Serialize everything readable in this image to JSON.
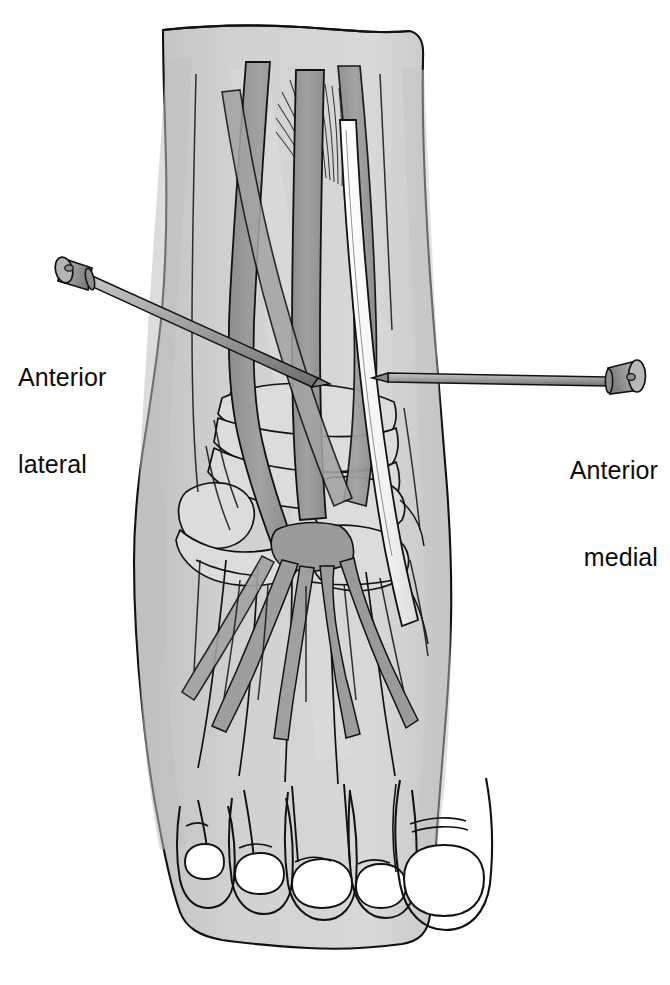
{
  "figure": {
    "background_color": "#ffffff"
  },
  "labels": {
    "anterior_lateral": {
      "line1": "Anterior",
      "line2": "lateral",
      "align": "left"
    },
    "anterior_medial": {
      "line1": "Anterior",
      "line2": "medial",
      "align": "right"
    }
  },
  "colors": {
    "skin_fill": "#d2d2d2",
    "skin_shadow": "#b9b9b9",
    "skin_highlight": "#dedede",
    "bone_fill": "#dcdcdc",
    "bone_light": "#e4e4e4",
    "tendon_dark": "#969696",
    "tendon_mid": "#a8a8a8",
    "tendon_white": "#fbfbfb",
    "nail_fill": "#ffffff",
    "outline": "#111111",
    "instrument_body": "#9d9d9d",
    "instrument_light": "#c3c3c3",
    "instrument_dark": "#6f6f6f",
    "label_text": "#0c0c0c"
  },
  "instruments": [
    {
      "name": "anterolateral-cannula",
      "hub_position": "upper-left",
      "tip_position": "ankle-joint-center",
      "direction": "enters from superolateral, angles inferomedially"
    },
    {
      "name": "anteromedial-cannula",
      "hub_position": "right",
      "tip_position": "ankle-joint-medial",
      "direction": "enters horizontally from medial side"
    }
  ],
  "anatomy": {
    "toes_count": 5,
    "nails_count": 5,
    "structures": [
      "extensor tendons",
      "tarsal bones",
      "metatarsals",
      "tibialis anterior tendon",
      "muscle belly fibers",
      "dorsalis pedis vessels"
    ]
  }
}
